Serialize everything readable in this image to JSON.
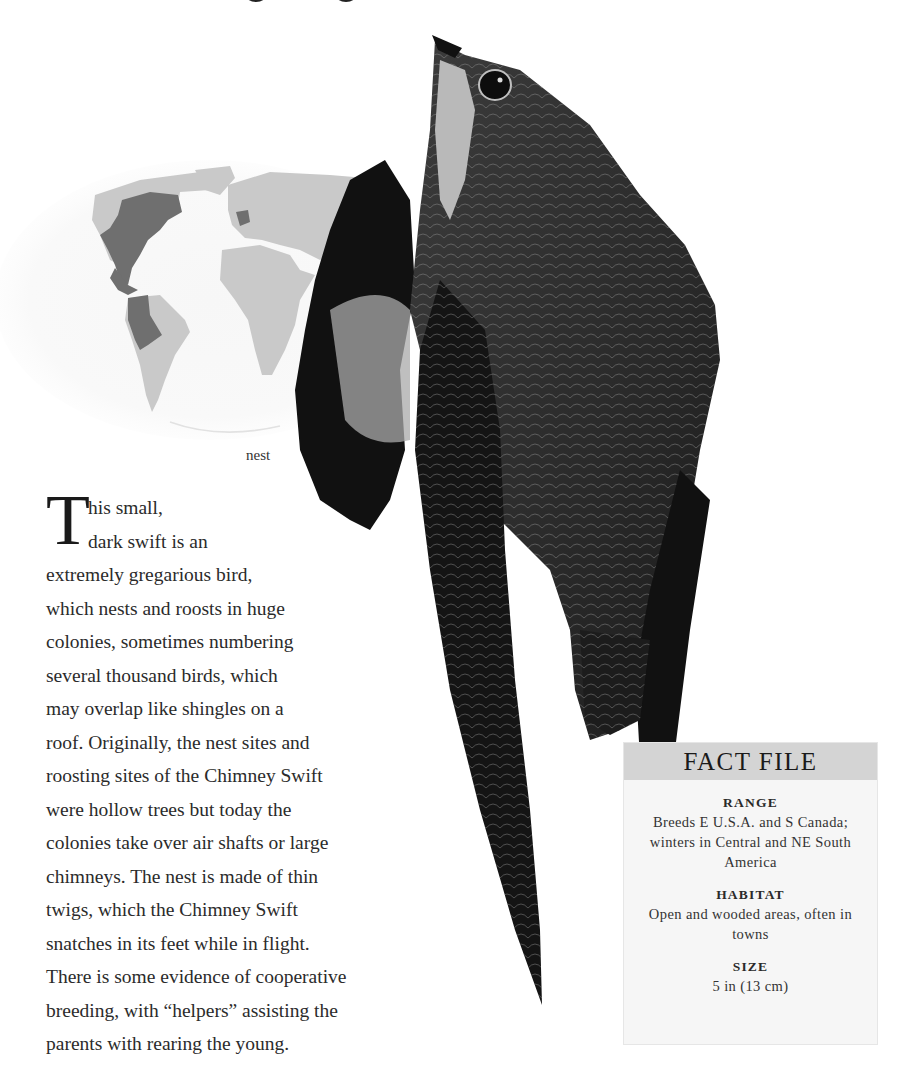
{
  "map": {
    "label": "range map",
    "colors": {
      "land": "#c9c9c9",
      "range": "#6f6f6f",
      "ocean_fade": "#f4f4f4"
    }
  },
  "illustration": {
    "subject": "Chimney Swift",
    "nest_label": "nest"
  },
  "body": {
    "drop_cap": "T",
    "lines": [
      "his small,",
      "dark swift is an",
      "extremely gregarious bird,",
      "which nests and roosts in huge",
      "colonies, sometimes numbering",
      "several thousand birds, which",
      "may overlap like shingles on a",
      "roof. Originally, the nest sites and",
      "roosting sites of the Chimney Swift",
      "were hollow trees but today the",
      "colonies take over air shafts or large",
      "chimneys. The nest is made of thin",
      "twigs, which the Chimney Swift",
      "snatches in its feet while in flight.",
      "There is some evidence of cooperative",
      "breeding, with “helpers” assisting the",
      "parents with rearing the young."
    ]
  },
  "fact_file": {
    "title": "FACT FILE",
    "header_color": "#d4d4d4",
    "body_color": "#f6f6f6",
    "sections": [
      {
        "heading": "RANGE",
        "value": "Breeds E U.S.A. and S Canada; winters in Central and NE South America"
      },
      {
        "heading": "HABITAT",
        "value": "Open and wooded areas, often in towns"
      },
      {
        "heading": "SIZE",
        "value": "5 in (13 cm)"
      }
    ]
  }
}
